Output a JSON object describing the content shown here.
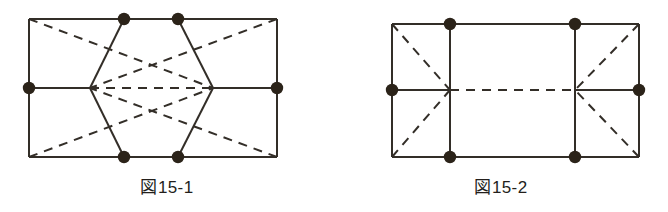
{
  "page": {
    "background_color": "#ffffff",
    "width": 668,
    "height": 212
  },
  "style": {
    "line_color": "#332e28",
    "dot_color": "#2b2319",
    "solid_width": 2.0,
    "dash_width": 2.0,
    "dash_pattern": "9 7",
    "dot_radius": 6.2
  },
  "figures": [
    {
      "id": "figure-15-1",
      "caption": "ա15-1",
      "caption_text": "図15-1",
      "rect": {
        "x1": 29,
        "y1": 19,
        "x2": 277,
        "y2": 157
      },
      "description": "rectangle with dashed diagonals and solid hexagon",
      "solid_segments": [
        {
          "name": "rect-top",
          "x1": 29,
          "y1": 19,
          "x2": 277,
          "y2": 19
        },
        {
          "name": "rect-bottom",
          "x1": 29,
          "y1": 157,
          "x2": 277,
          "y2": 157
        },
        {
          "name": "rect-left",
          "x1": 29,
          "y1": 19,
          "x2": 29,
          "y2": 157
        },
        {
          "name": "rect-right",
          "x1": 277,
          "y1": 19,
          "x2": 277,
          "y2": 157
        },
        {
          "name": "hex-upper-left",
          "x1": 90,
          "y1": 88,
          "x2": 124,
          "y2": 19
        },
        {
          "name": "hex-top",
          "x1": 124,
          "y1": 19,
          "x2": 178,
          "y2": 19
        },
        {
          "name": "hex-upper-right",
          "x1": 178,
          "y1": 19,
          "x2": 213,
          "y2": 88
        },
        {
          "name": "hex-lower-right",
          "x1": 213,
          "y1": 88,
          "x2": 178,
          "y2": 157
        },
        {
          "name": "hex-bottom",
          "x1": 178,
          "y1": 157,
          "x2": 124,
          "y2": 157
        },
        {
          "name": "hex-lower-left",
          "x1": 124,
          "y1": 157,
          "x2": 90,
          "y2": 88
        },
        {
          "name": "mid-left-stub",
          "x1": 29,
          "y1": 88,
          "x2": 90,
          "y2": 88
        },
        {
          "name": "mid-right-stub",
          "x1": 213,
          "y1": 88,
          "x2": 277,
          "y2": 88
        }
      ],
      "dashed_segments": [
        {
          "name": "diag-tl-to-center",
          "x1": 29,
          "y1": 19,
          "x2": 213,
          "y2": 88
        },
        {
          "name": "diag-bl-to-center",
          "x1": 29,
          "y1": 157,
          "x2": 213,
          "y2": 88
        },
        {
          "name": "diag-tr-to-center",
          "x1": 277,
          "y1": 19,
          "x2": 90,
          "y2": 88
        },
        {
          "name": "diag-br-to-center",
          "x1": 277,
          "y1": 157,
          "x2": 90,
          "y2": 88
        },
        {
          "name": "horizontal-middle",
          "x1": 90,
          "y1": 88,
          "x2": 213,
          "y2": 88
        }
      ],
      "dots": [
        {
          "name": "dot-top-left-inner",
          "x": 124,
          "y": 19
        },
        {
          "name": "dot-top-right-inner",
          "x": 178,
          "y": 19
        },
        {
          "name": "dot-bottom-left-inner",
          "x": 124,
          "y": 157
        },
        {
          "name": "dot-bottom-right-inner",
          "x": 178,
          "y": 157
        },
        {
          "name": "dot-left-middle",
          "x": 29,
          "y": 88
        },
        {
          "name": "dot-right-middle",
          "x": 277,
          "y": 88
        }
      ]
    },
    {
      "id": "figure-15-2",
      "caption": "図15-2",
      "rect": {
        "x1": 392,
        "y1": 24,
        "x2": 639,
        "y2": 157
      },
      "description": "rectangle split by two vertical lines with dashed diagonals in end panels",
      "solid_segments": [
        {
          "name": "rect-top",
          "x1": 392,
          "y1": 24,
          "x2": 639,
          "y2": 24
        },
        {
          "name": "rect-bottom",
          "x1": 392,
          "y1": 157,
          "x2": 639,
          "y2": 157
        },
        {
          "name": "rect-left",
          "x1": 392,
          "y1": 24,
          "x2": 392,
          "y2": 157
        },
        {
          "name": "rect-right",
          "x1": 639,
          "y1": 24,
          "x2": 639,
          "y2": 157
        },
        {
          "name": "vertical-left-divider",
          "x1": 450,
          "y1": 24,
          "x2": 450,
          "y2": 157
        },
        {
          "name": "vertical-right-divider",
          "x1": 575,
          "y1": 24,
          "x2": 575,
          "y2": 157
        },
        {
          "name": "mid-left-stub",
          "x1": 392,
          "y1": 90,
          "x2": 450,
          "y2": 90
        },
        {
          "name": "mid-right-stub",
          "x1": 575,
          "y1": 90,
          "x2": 639,
          "y2": 90
        }
      ],
      "dashed_segments": [
        {
          "name": "left-panel-diag-down",
          "x1": 392,
          "y1": 24,
          "x2": 450,
          "y2": 90
        },
        {
          "name": "left-panel-diag-up",
          "x1": 392,
          "y1": 157,
          "x2": 450,
          "y2": 90
        },
        {
          "name": "right-panel-diag-down",
          "x1": 639,
          "y1": 24,
          "x2": 575,
          "y2": 90
        },
        {
          "name": "right-panel-diag-up",
          "x1": 639,
          "y1": 157,
          "x2": 575,
          "y2": 90
        },
        {
          "name": "horizontal-middle",
          "x1": 450,
          "y1": 90,
          "x2": 575,
          "y2": 90
        }
      ],
      "dots": [
        {
          "name": "dot-top-left-inner",
          "x": 450,
          "y": 24
        },
        {
          "name": "dot-top-right-inner",
          "x": 575,
          "y": 24
        },
        {
          "name": "dot-bottom-left-inner",
          "x": 450,
          "y": 157
        },
        {
          "name": "dot-bottom-right-inner",
          "x": 575,
          "y": 157
        },
        {
          "name": "dot-left-middle",
          "x": 392,
          "y": 90
        },
        {
          "name": "dot-right-middle",
          "x": 639,
          "y": 90
        }
      ]
    }
  ],
  "captions": {
    "left": "図15-1",
    "right": "図15-2"
  }
}
